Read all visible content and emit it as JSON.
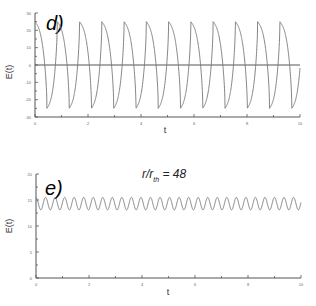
{
  "chart_data": [
    {
      "type": "line",
      "panel_label": "d)",
      "title": "",
      "xlabel": "t",
      "ylabel": "E(t)",
      "xlim": [
        0,
        10
      ],
      "ylim": [
        -30,
        30
      ],
      "x_ticks": [
        0,
        2,
        4,
        6,
        8,
        10
      ],
      "x_tick_labels": [
        "0",
        "2",
        "4",
        "6",
        "8",
        "10"
      ],
      "y_ticks": [
        -30,
        -20,
        -10,
        0,
        10,
        20,
        30
      ],
      "y_tick_labels": [
        "-30",
        "-20",
        "-10",
        "0",
        "10",
        "20",
        "30"
      ],
      "zero_line": true,
      "series": [
        {
          "name": "E(t)",
          "description": "periodic spiky oscillation with cusp-like peaks at about +25 and troughs at about -25",
          "period": 0.84,
          "peak_value": 25,
          "trough_value": -25,
          "first_peak_t": 0.0,
          "first_trough_t": 0.45
        }
      ]
    },
    {
      "type": "line",
      "panel_label": "e)",
      "title": "",
      "annotation": {
        "main": "r/r",
        "sub": "th",
        "rest": " = 48"
      },
      "xlabel": "t",
      "ylabel": "E(t)",
      "xlim": [
        0,
        10
      ],
      "ylim": [
        0,
        20
      ],
      "x_ticks": [
        0,
        2,
        4,
        6,
        8,
        10
      ],
      "x_tick_labels": [
        "0",
        "2",
        "4",
        "6",
        "8",
        "10"
      ],
      "y_ticks": [
        0,
        5,
        10,
        15,
        20
      ],
      "y_tick_labels": [
        "0",
        "5",
        "10",
        "15",
        "20"
      ],
      "zero_line": false,
      "series": [
        {
          "name": "E(t)",
          "description": "small regular oscillation around ~14.3",
          "period": 0.36,
          "max_value": 15.5,
          "min_value": 13.1
        }
      ]
    }
  ]
}
